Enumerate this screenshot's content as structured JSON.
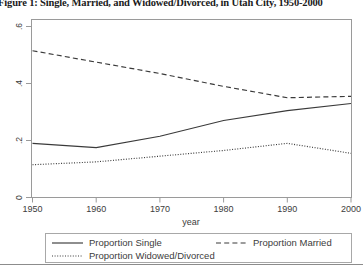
{
  "figure": {
    "caption": "Figure 1: Single, Married, and Widowed/Divorced, in Utah City, 1950-2000",
    "background": "#ffffff",
    "line_color": "#3a3a3a",
    "axis_color": "#9a9a9a"
  },
  "chart_data": {
    "type": "line",
    "title": "",
    "xlabel": "year",
    "ylabel": "",
    "xlim": [
      1950,
      2000
    ],
    "ylim": [
      0,
      0.6
    ],
    "grid": false,
    "legend_position": "bottom",
    "x": [
      1950,
      1960,
      1970,
      1980,
      1990,
      2000
    ],
    "xticks": [
      "1950",
      "1960",
      "1970",
      "1980",
      "1990",
      "2000"
    ],
    "yticks": [
      "0",
      ".2",
      ".4",
      ".6"
    ],
    "ytick_values": [
      0,
      0.2,
      0.4,
      0.6
    ],
    "series": [
      {
        "name": "Proportion Single",
        "style": "solid",
        "values": [
          0.19,
          0.175,
          0.215,
          0.27,
          0.305,
          0.33
        ]
      },
      {
        "name": "Proportion Married",
        "style": "dashed",
        "values": [
          0.515,
          0.475,
          0.435,
          0.39,
          0.35,
          0.355
        ]
      },
      {
        "name": "Proportion Widowed/Divorced",
        "style": "dotted",
        "values": [
          0.115,
          0.125,
          0.145,
          0.165,
          0.19,
          0.155
        ]
      }
    ]
  },
  "legend": {
    "items": [
      {
        "label": "Proportion Single",
        "style": "solid"
      },
      {
        "label": "Proportion Married",
        "style": "dashed"
      },
      {
        "label": "Proportion Widowed/Divorced",
        "style": "dotted"
      }
    ]
  }
}
